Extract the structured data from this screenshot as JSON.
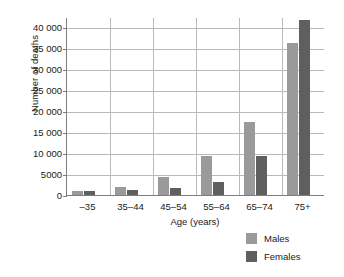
{
  "chart_data": {
    "type": "bar",
    "title": "",
    "xlabel": "Age (years)",
    "ylabel": "Number of deaths",
    "categories": [
      "–35",
      "35–44",
      "45–54",
      "55–64",
      "65–74",
      "75+"
    ],
    "series": [
      {
        "name": "Males",
        "color": "#9a9a9a",
        "values": [
          900,
          2000,
          4200,
          9200,
          17500,
          36200
        ]
      },
      {
        "name": "Females",
        "color": "#5f5f5f",
        "values": [
          900,
          1300,
          1600,
          3100,
          9200,
          41800
        ]
      }
    ],
    "ylim": [
      0,
      42500
    ],
    "yticks": [
      0,
      5000,
      10000,
      15000,
      20000,
      25000,
      30000,
      35000,
      40000
    ],
    "ytick_labels": [
      "0",
      "5000",
      "10 000",
      "15 000",
      "20 000",
      "25 000",
      "30 000",
      "35 000",
      "40 000"
    ],
    "grid": "horizontal-and-category-separators",
    "legend_position": "bottom-right"
  },
  "axes": {
    "y_title": "Number of deaths",
    "x_title": "Age (years)"
  },
  "legend": {
    "entries": [
      {
        "label": "Males"
      },
      {
        "label": "Females"
      }
    ]
  }
}
